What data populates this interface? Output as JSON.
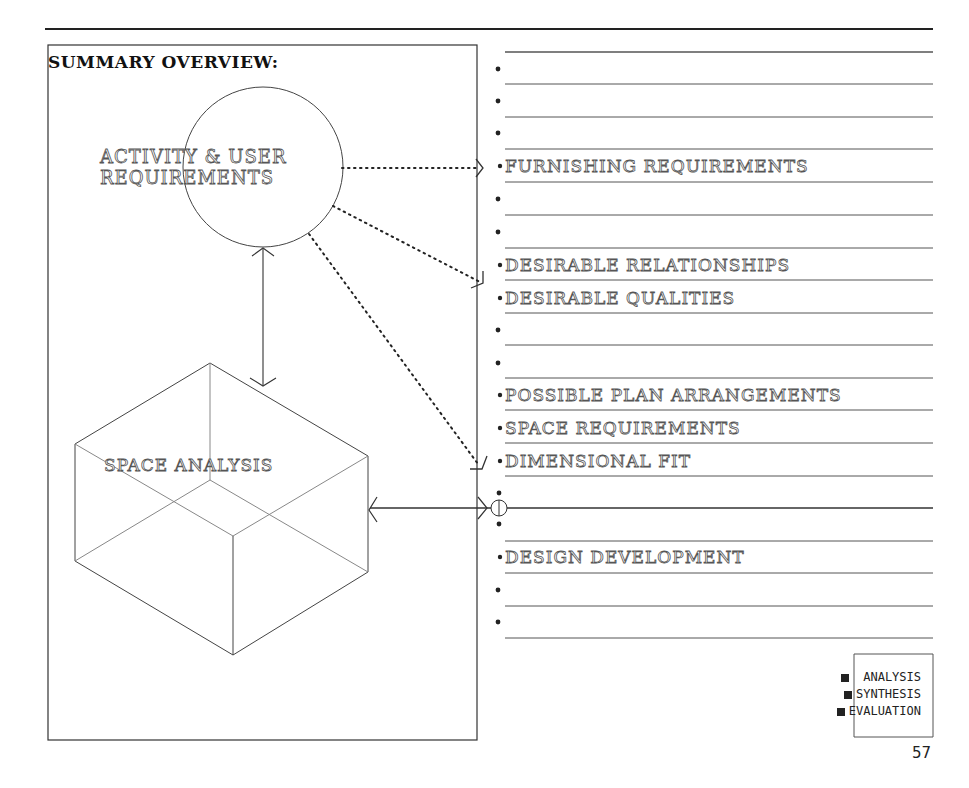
{
  "page": {
    "title": "SUMMARY OVERVIEW:",
    "page_number": "57"
  },
  "diagram": {
    "nodes": [
      {
        "id": "activity",
        "shape": "circle",
        "label_line1": "ACTIVITY & USER",
        "label_line2": "REQUIREMENTS"
      },
      {
        "id": "space",
        "shape": "isometric-box",
        "label": "SPACE ANALYSIS"
      }
    ],
    "checklist": [
      {
        "label": ""
      },
      {
        "label": ""
      },
      {
        "label": ""
      },
      {
        "label": "FURNISHING REQUIREMENTS"
      },
      {
        "label": ""
      },
      {
        "label": ""
      },
      {
        "label": "DESIRABLE  RELATIONSHIPS"
      },
      {
        "label": "DESIRABLE  QUALITIES"
      },
      {
        "label": ""
      },
      {
        "label": ""
      },
      {
        "label": "POSSIBLE PLAN  ARRANGEMENTS"
      },
      {
        "label": "SPACE REQUIREMENTS"
      },
      {
        "label": "DIMENSIONAL  FIT"
      },
      {
        "label": ""
      },
      {
        "label": "DESIGN  DEVELOPMENT"
      },
      {
        "label": ""
      },
      {
        "label": ""
      }
    ],
    "connections": [
      {
        "from": "activity",
        "to": "FURNISHING REQUIREMENTS",
        "style": "dotted"
      },
      {
        "from": "activity",
        "to": "DESIRABLE RELATIONSHIPS",
        "style": "dotted"
      },
      {
        "from": "activity",
        "to": "DIMENSIONAL FIT",
        "style": "dotted"
      },
      {
        "from": "activity",
        "to": "space",
        "style": "solid-double-arrow"
      },
      {
        "from": "space",
        "to": "decision-point",
        "style": "solid-double-arrow"
      }
    ]
  },
  "legend": {
    "items": [
      {
        "label": "ANALYSIS"
      },
      {
        "label": "SYNTHESIS"
      },
      {
        "label": "EVALUATION"
      }
    ]
  }
}
